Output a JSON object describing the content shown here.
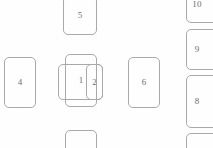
{
  "canvas": {
    "width": 213,
    "height": 148,
    "background_color": "#fefefe",
    "stroke_color": "#a9a9a9",
    "label_color": "#6e6e6e"
  },
  "cards": [
    {
      "id": "card-5",
      "label": "5",
      "x": 63,
      "y": -4,
      "width": 34,
      "height": 39,
      "clipped": "top",
      "label_visible": true
    },
    {
      "id": "card-4",
      "label": "4",
      "x": 4,
      "y": 57,
      "width": 32,
      "height": 51,
      "clipped": "none",
      "label_visible": true
    },
    {
      "id": "card-1-under-left",
      "label": "",
      "x": 58,
      "y": 64,
      "width": 45,
      "height": 36,
      "clipped": "none",
      "label_visible": false
    },
    {
      "id": "card-2",
      "label": "2",
      "x": 86,
      "y": 64,
      "width": 17,
      "height": 36,
      "clipped": "none",
      "label_visible": true
    },
    {
      "id": "card-1",
      "label": "1",
      "x": 65,
      "y": 54,
      "width": 32,
      "height": 53,
      "clipped": "none",
      "label_visible": true
    },
    {
      "id": "card-6",
      "label": "6",
      "x": 128,
      "y": 57,
      "width": 32,
      "height": 51,
      "clipped": "none",
      "label_visible": true
    },
    {
      "id": "card-bottom-center",
      "label": "",
      "x": 65,
      "y": 130,
      "width": 32,
      "height": 30,
      "clipped": "bottom",
      "label_visible": false
    },
    {
      "id": "card-10",
      "label": "10",
      "x": 186,
      "y": -14,
      "width": 38,
      "height": 37,
      "clipped": "top-right",
      "label_visible": true
    },
    {
      "id": "card-9",
      "label": "9",
      "x": 186,
      "y": 29,
      "width": 38,
      "height": 41,
      "clipped": "right",
      "label_visible": true
    },
    {
      "id": "card-8",
      "label": "8",
      "x": 186,
      "y": 75,
      "width": 38,
      "height": 53,
      "clipped": "right",
      "label_visible": true
    },
    {
      "id": "card-bottom-right",
      "label": "",
      "x": 186,
      "y": 133,
      "width": 38,
      "height": 30,
      "clipped": "bottom-right",
      "label_visible": false
    }
  ]
}
